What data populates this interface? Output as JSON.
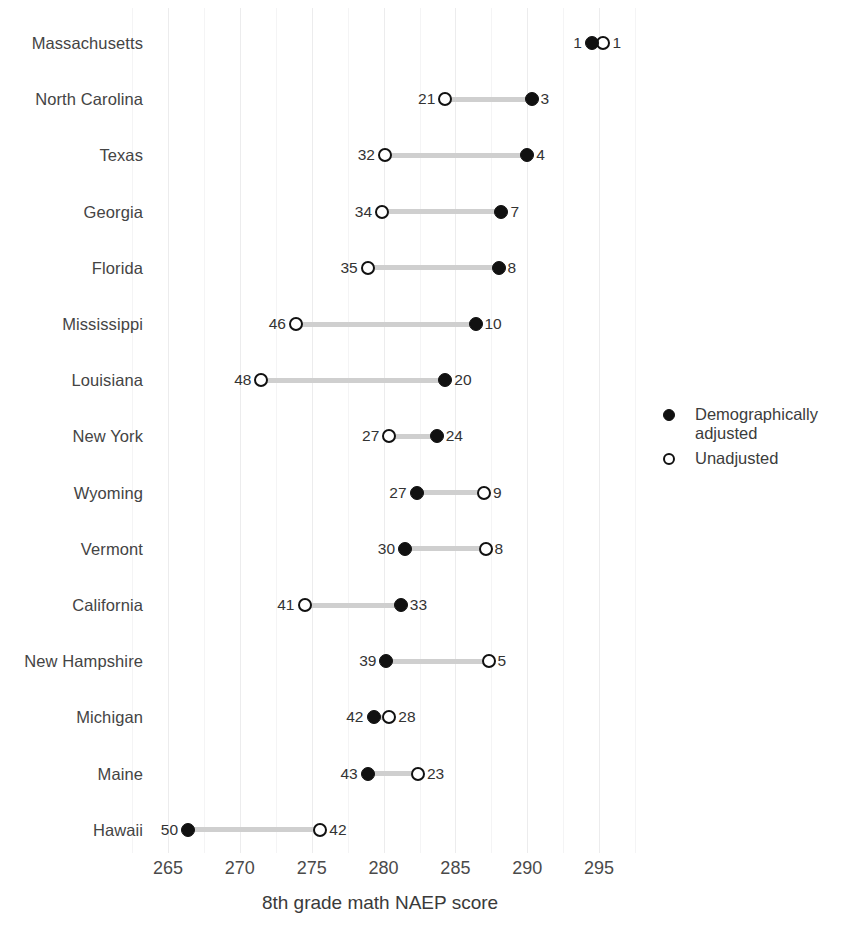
{
  "chart_data": {
    "type": "dumbbell",
    "title": "",
    "xlabel": "8th grade math NAEP score",
    "ylabel": "",
    "xlim": [
      262.5,
      297.5
    ],
    "xticks": [
      265,
      270,
      275,
      280,
      285,
      290,
      295
    ],
    "xtick_labels": [
      "265",
      "270",
      "275",
      "280",
      "285",
      "290",
      "295"
    ],
    "grid": "vertical",
    "legend_position": "right-middle",
    "series": [
      {
        "name": "Demographically adjusted",
        "marker": "filled-circle"
      },
      {
        "name": "Unadjusted",
        "marker": "open-circle"
      }
    ],
    "categories": [
      "Massachusetts",
      "North Carolina",
      "Texas",
      "Georgia",
      "Florida",
      "Mississippi",
      "Louisiana",
      "New York",
      "Wyoming",
      "Vermont",
      "California",
      "New Hampshire",
      "Michigan",
      "Maine",
      "Hawaii"
    ],
    "rows": [
      {
        "state": "Massachusetts",
        "adjusted_score": 294.5,
        "unadjusted_score": 295.3,
        "adjusted_rank": "1",
        "unadjusted_rank": "1"
      },
      {
        "state": "North Carolina",
        "adjusted_score": 290.3,
        "unadjusted_score": 284.3,
        "adjusted_rank": "3",
        "unadjusted_rank": "21"
      },
      {
        "state": "Texas",
        "adjusted_score": 290.0,
        "unadjusted_score": 280.1,
        "adjusted_rank": "4",
        "unadjusted_rank": "32"
      },
      {
        "state": "Georgia",
        "adjusted_score": 288.2,
        "unadjusted_score": 279.9,
        "adjusted_rank": "7",
        "unadjusted_rank": "34"
      },
      {
        "state": "Florida",
        "adjusted_score": 288.0,
        "unadjusted_score": 278.9,
        "adjusted_rank": "8",
        "unadjusted_rank": "35"
      },
      {
        "state": "Mississippi",
        "adjusted_score": 286.4,
        "unadjusted_score": 273.9,
        "adjusted_rank": "10",
        "unadjusted_rank": "46"
      },
      {
        "state": "Louisiana",
        "adjusted_score": 284.3,
        "unadjusted_score": 271.5,
        "adjusted_rank": "20",
        "unadjusted_rank": "48"
      },
      {
        "state": "New York",
        "adjusted_score": 283.7,
        "unadjusted_score": 280.4,
        "adjusted_rank": "24",
        "unadjusted_rank": "27"
      },
      {
        "state": "Wyoming",
        "adjusted_score": 282.3,
        "unadjusted_score": 287.0,
        "adjusted_rank": "27",
        "unadjusted_rank": "9"
      },
      {
        "state": "Vermont",
        "adjusted_score": 281.5,
        "unadjusted_score": 287.1,
        "adjusted_rank": "30",
        "unadjusted_rank": "8"
      },
      {
        "state": "California",
        "adjusted_score": 281.2,
        "unadjusted_score": 274.5,
        "adjusted_rank": "33",
        "unadjusted_rank": "41"
      },
      {
        "state": "New Hampshire",
        "adjusted_score": 280.2,
        "unadjusted_score": 287.3,
        "adjusted_rank": "39",
        "unadjusted_rank": "5"
      },
      {
        "state": "Michigan",
        "adjusted_score": 279.3,
        "unadjusted_score": 280.4,
        "adjusted_rank": "42",
        "unadjusted_rank": "28"
      },
      {
        "state": "Maine",
        "adjusted_score": 278.9,
        "unadjusted_score": 282.4,
        "adjusted_rank": "43",
        "unadjusted_rank": "23"
      },
      {
        "state": "Hawaii",
        "adjusted_score": 266.4,
        "unadjusted_score": 275.6,
        "adjusted_rank": "50",
        "unadjusted_rank": "42"
      }
    ]
  },
  "axis": {
    "title": "8th grade math NAEP score"
  },
  "legend": {
    "items": [
      {
        "label": "Demographically adjusted",
        "marker": "filled-circle"
      },
      {
        "label": "Unadjusted",
        "marker": "open-circle"
      }
    ]
  }
}
